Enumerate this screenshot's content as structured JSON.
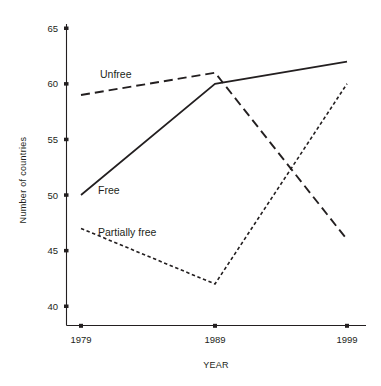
{
  "chart_data": {
    "type": "line",
    "title": "",
    "xlabel": "YEAR",
    "ylabel": "Number of countries",
    "x": [
      1979,
      1989,
      1999
    ],
    "xticklabels": [
      "1979",
      "1989",
      "1999"
    ],
    "yticklabels": [
      "40",
      "45",
      "50",
      "55",
      "60",
      "65"
    ],
    "yticks": [
      40,
      45,
      50,
      55,
      60,
      65
    ],
    "ylim": [
      38.3,
      65
    ],
    "xlim": [
      1977.5,
      2000.5
    ],
    "grid": false,
    "legend": "inline-labels",
    "series": [
      {
        "name": "Free",
        "values": [
          50,
          60,
          62
        ],
        "style": "solid"
      },
      {
        "name": "Unfree",
        "values": [
          59,
          61,
          46
        ],
        "style": "long-dash"
      },
      {
        "name": "Partially free",
        "values": [
          47,
          42,
          60
        ],
        "style": "short-dash"
      }
    ]
  },
  "labels": {
    "free": "Free",
    "unfree": "Unfree",
    "partially_free": "Partially free",
    "xaxis": "YEAR",
    "yaxis": "Number of countries",
    "ytick_65": "65",
    "ytick_60": "60",
    "ytick_55": "55",
    "ytick_50": "50",
    "ytick_45": "45",
    "ytick_40": "40",
    "xtick_1979": "1979",
    "xtick_1989": "1989",
    "xtick_1999": "1999"
  },
  "colors": {
    "ink": "#231f20",
    "background": "#ffffff"
  }
}
